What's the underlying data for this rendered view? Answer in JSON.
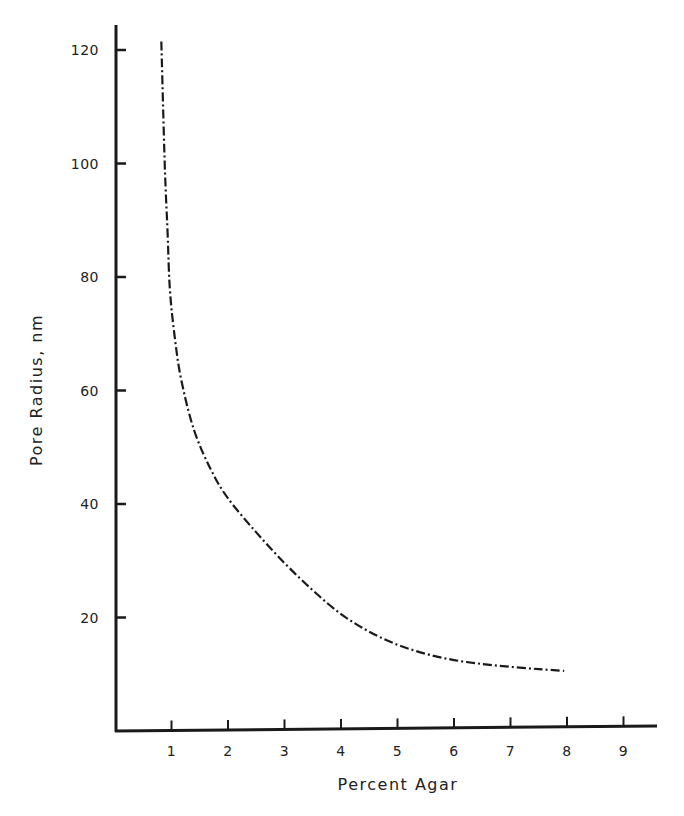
{
  "chart_data": {
    "type": "line",
    "title": "",
    "xlabel": "Percent Agar",
    "ylabel": "Pore Radius, nm",
    "xlim": [
      0,
      9.6
    ],
    "ylim": [
      0,
      120
    ],
    "x_ticks": [
      1,
      2,
      3,
      4,
      5,
      6,
      7,
      8,
      9
    ],
    "y_ticks": [
      20,
      40,
      60,
      80,
      100,
      120
    ],
    "grid": false,
    "legend": null,
    "line_style": "dash-dot",
    "series": [
      {
        "name": "Pore Radius",
        "x": [
          0.82,
          0.88,
          0.93,
          0.97,
          1.05,
          1.17,
          1.4,
          1.7,
          2.0,
          2.5,
          3.0,
          3.5,
          4.0,
          4.5,
          5.0,
          5.5,
          6.0,
          6.5,
          7.0,
          7.5,
          7.95
        ],
        "values": [
          121.5,
          100,
          88,
          78,
          70,
          62,
          53,
          46,
          41,
          35,
          29.6,
          24.8,
          20.6,
          17.5,
          15.2,
          13.6,
          12.5,
          11.8,
          11.3,
          10.9,
          10.6
        ]
      }
    ]
  },
  "labels": {
    "xlabel": "Percent Agar",
    "ylabel": "Pore Radius, nm",
    "x_ticks": [
      "1",
      "2",
      "3",
      "4",
      "5",
      "6",
      "7",
      "8",
      "9"
    ],
    "y_ticks": [
      "20",
      "40",
      "60",
      "80",
      "100",
      "120"
    ]
  }
}
